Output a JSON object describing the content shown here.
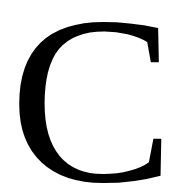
{
  "glyph": {
    "character": "C",
    "color": "#000000",
    "background": "#ffffff"
  }
}
